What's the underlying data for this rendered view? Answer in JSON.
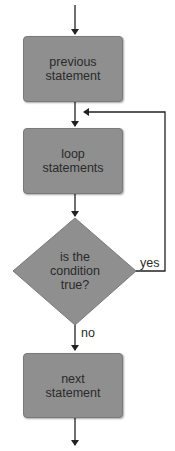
{
  "diagram": {
    "type": "flowchart",
    "nodes": {
      "previous": {
        "label": "previous\nstatement",
        "shape": "rect"
      },
      "loop": {
        "label": "loop\nstatements",
        "shape": "rect"
      },
      "condition": {
        "label": "is the\ncondition\ntrue?",
        "shape": "diamond"
      },
      "next": {
        "label": "next\nstatement",
        "shape": "rect"
      }
    },
    "edges": {
      "yes_label": "yes",
      "no_label": "no"
    },
    "colors": {
      "node_fill": "#8f8f8f",
      "line": "#222222",
      "text": "#2a2a2a"
    }
  }
}
